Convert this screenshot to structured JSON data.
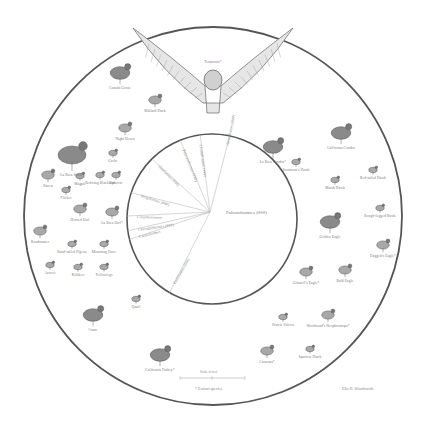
{
  "diagram": {
    "center_label": "Falconiformes (###)",
    "slices": [
      {
        "label": "Anseriformes (###)",
        "angle": -78
      },
      {
        "label": "Ciconiiformes (###)",
        "angle": -98
      },
      {
        "label": "Pelecaniformes (###)",
        "angle": -112
      },
      {
        "label": "Gruiformes (###)",
        "angle": -135
      },
      {
        "label": "Strigiformes (###)",
        "angle": -162
      },
      {
        "label": "Columbiformes",
        "angle": -178
      },
      {
        "label": "Charadriiformes (###)",
        "angle": 172
      },
      {
        "label": "Cuculiformes",
        "angle": 166
      },
      {
        "label": "Galliformes (###)",
        "angle": 120
      }
    ],
    "birds": [
      {
        "name": "Teratornis*",
        "x": 213,
        "y": 68,
        "size": "xl"
      },
      {
        "name": "Canada Goose",
        "x": 120,
        "y": 73,
        "size": "m"
      },
      {
        "name": "Mallard Duck",
        "x": 155,
        "y": 100,
        "size": "s"
      },
      {
        "name": "Night Heron",
        "x": 125,
        "y": 128,
        "size": "s"
      },
      {
        "name": "La Brea Stork*",
        "x": 72,
        "y": 155,
        "size": "l"
      },
      {
        "name": "Grebe",
        "x": 113,
        "y": 153,
        "size": "xs"
      },
      {
        "name": "Raven",
        "x": 48,
        "y": 175,
        "size": "s"
      },
      {
        "name": "Magpie",
        "x": 80,
        "y": 176,
        "size": "xs"
      },
      {
        "name": "Redwing Blackbird",
        "x": 100,
        "y": 175,
        "size": "xs"
      },
      {
        "name": "Sparrow",
        "x": 116,
        "y": 175,
        "size": "xs"
      },
      {
        "name": "Flicker",
        "x": 66,
        "y": 190,
        "size": "xs"
      },
      {
        "name": "Horned Owl",
        "x": 80,
        "y": 209,
        "size": "s"
      },
      {
        "name": "La Brea Owl*",
        "x": 112,
        "y": 212,
        "size": "s"
      },
      {
        "name": "Roadrunner",
        "x": 40,
        "y": 231,
        "size": "s"
      },
      {
        "name": "Band-tailed Pigeon",
        "x": 72,
        "y": 244,
        "size": "xs"
      },
      {
        "name": "Mourning Dove",
        "x": 104,
        "y": 244,
        "size": "xs"
      },
      {
        "name": "Avocet",
        "x": 50,
        "y": 265,
        "size": "xs"
      },
      {
        "name": "Killdeer",
        "x": 78,
        "y": 267,
        "size": "xs"
      },
      {
        "name": "Yellowlegs",
        "x": 104,
        "y": 267,
        "size": "xs"
      },
      {
        "name": "Crane",
        "x": 93,
        "y": 315,
        "size": "m"
      },
      {
        "name": "Quail",
        "x": 136,
        "y": 299,
        "size": "xs"
      },
      {
        "name": "California Turkey*",
        "x": 160,
        "y": 355,
        "size": "m"
      },
      {
        "name": "La Brea Condor*",
        "x": 273,
        "y": 147,
        "size": "m"
      },
      {
        "name": "California Condor",
        "x": 341,
        "y": 133,
        "size": "m"
      },
      {
        "name": "Swainson's Hawk",
        "x": 296,
        "y": 162,
        "size": "xs"
      },
      {
        "name": "Marsh Hawk",
        "x": 335,
        "y": 180,
        "size": "xs"
      },
      {
        "name": "Red-tailed Hawk",
        "x": 373,
        "y": 170,
        "size": "xs"
      },
      {
        "name": "Rough-legged Hawk",
        "x": 380,
        "y": 208,
        "size": "xs"
      },
      {
        "name": "Golden Eagle",
        "x": 330,
        "y": 222,
        "size": "m"
      },
      {
        "name": "Daggett's Eagle*",
        "x": 383,
        "y": 245,
        "size": "s"
      },
      {
        "name": "Grinnell's Eagle*",
        "x": 306,
        "y": 272,
        "size": "s"
      },
      {
        "name": "Bald Eagle",
        "x": 345,
        "y": 270,
        "size": "s"
      },
      {
        "name": "Prairie Falcon",
        "x": 283,
        "y": 317,
        "size": "xs"
      },
      {
        "name": "Woodward's Neophrontops*",
        "x": 328,
        "y": 315,
        "size": "s"
      },
      {
        "name": "Caracara*",
        "x": 267,
        "y": 351,
        "size": "s"
      },
      {
        "name": "Sparrow Hawk",
        "x": 310,
        "y": 349,
        "size": "xs"
      }
    ],
    "footer": {
      "scale_label": "Scale in feet",
      "footnote": "* Extinct species",
      "credit": "Ella H. Woodwards"
    }
  }
}
